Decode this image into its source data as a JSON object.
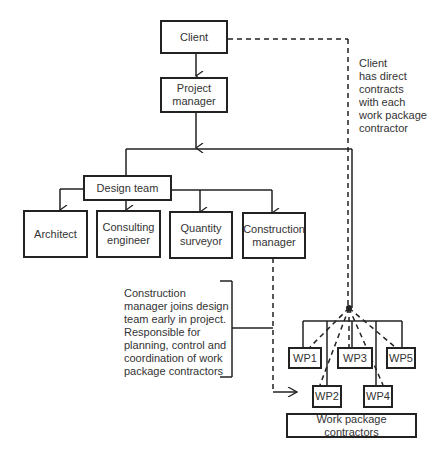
{
  "diagram": {
    "type": "organization-chart",
    "nodes": {
      "client": "Client",
      "project_manager": "Project\nmanager",
      "design_team": "Design team",
      "architect": "Architect",
      "consulting_engineer": "Consulting\nengineer",
      "quantity_surveyor": "Quantity\nsurveyor",
      "construction_manager": "Construction\nmanager",
      "wp1": "WP1",
      "wp2": "WP2",
      "wp3": "WP3",
      "wp4": "WP4",
      "wp5": "WP5",
      "work_package_contractors": "Work package contractors"
    },
    "annotations": {
      "client_contracts": "Client\nhas direct\ncontracts\nwith each\nwork package\ncontractor",
      "construction_manager_role": "Construction\nmanager joins design\nteam early in project.\nResponsible for\nplanning, control and\ncoordination of work\npackage contractors"
    },
    "edges": [
      {
        "from": "Client",
        "to": "Project manager",
        "style": "solid-arrow"
      },
      {
        "from": "Project manager",
        "to": "Design team",
        "style": "solid-arrow"
      },
      {
        "from": "Design team",
        "to": "Architect",
        "style": "solid-arrow"
      },
      {
        "from": "Design team",
        "to": "Consulting engineer",
        "style": "solid-arrow"
      },
      {
        "from": "Design team",
        "to": "Quantity surveyor",
        "style": "solid-arrow"
      },
      {
        "from": "Design team",
        "to": "Construction manager",
        "style": "solid-arrow"
      },
      {
        "from": "Client",
        "to": "Work package contractors",
        "style": "dashed"
      },
      {
        "from": "Construction manager",
        "to": "Work package contractors",
        "style": "dashed-arrow"
      }
    ]
  }
}
